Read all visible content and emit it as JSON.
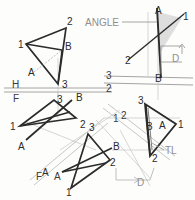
{
  "drawing": {
    "title": "Descriptive geometry — angle between line and plane",
    "callouts": {
      "angle": "ANGLE",
      "true_length": "TL",
      "dim_d_top": "D",
      "dim_d_bottom": "D"
    },
    "fold_lines": [
      {
        "name": "h-f",
        "upper": "H",
        "lower": "F",
        "orientation": "horizontal"
      },
      {
        "name": "three-two",
        "upper": "3",
        "lower": "2",
        "orientation": "horizontal"
      },
      {
        "name": "one-two",
        "upper": "1",
        "lower": "2",
        "orientation": "diagonal"
      },
      {
        "name": "f-a",
        "upper": "F",
        "lower": "A",
        "orientation": "diagonal"
      }
    ],
    "views": [
      {
        "name": "top-view",
        "vertices": [
          {
            "label": "1",
            "x": 22,
            "y": 44
          },
          {
            "label": "2",
            "x": 66,
            "y": 22
          },
          {
            "label": "3",
            "x": 58,
            "y": 80
          }
        ],
        "points": [
          {
            "label": "A",
            "x": 26,
            "y": 71
          },
          {
            "label": "B",
            "x": 62,
            "y": 46
          }
        ]
      },
      {
        "name": "front-view",
        "vertices": [
          {
            "label": "1",
            "x": 15,
            "y": 125
          },
          {
            "label": "2",
            "x": 70,
            "y": 125
          },
          {
            "label": "3",
            "x": 50,
            "y": 97
          }
        ],
        "points": [
          {
            "label": "A",
            "x": 21,
            "y": 144
          },
          {
            "label": "B",
            "x": 74,
            "y": 94
          }
        ]
      },
      {
        "name": "auxiliary-view-1",
        "vertices": [
          {
            "label": "1",
            "x": 70,
            "y": 186
          },
          {
            "label": "2",
            "x": 104,
            "y": 165
          },
          {
            "label": "3",
            "x": 88,
            "y": 130
          }
        ],
        "points": [
          {
            "label": "A",
            "x": 50,
            "y": 174
          },
          {
            "label": "B",
            "x": 114,
            "y": 146
          }
        ]
      },
      {
        "name": "auxiliary-view-2",
        "vertices": [
          {
            "label": "3",
            "x": 144,
            "y": 100
          },
          {
            "label": "1",
            "x": 176,
            "y": 125
          },
          {
            "label": "2",
            "x": 152,
            "y": 153
          }
        ],
        "points": [
          {
            "label": "A",
            "x": 158,
            "y": 126
          },
          {
            "label": "B",
            "x": 147,
            "y": 125
          }
        ]
      },
      {
        "name": "edge-view",
        "vertices": [
          {
            "label": "2",
            "x": 127,
            "y": 58
          },
          {
            "label": "1",
            "x": 182,
            "y": 16
          }
        ],
        "points": [
          {
            "label": "A",
            "x": 156,
            "y": 12
          },
          {
            "label": "B",
            "x": 158,
            "y": 75
          }
        ]
      }
    ],
    "colors": {
      "object_line": "#2b2b2b",
      "construction_line": "#b7b7b7",
      "fold_line": "#9a9a9a",
      "label_text": "#3b3b3b",
      "callout_text": "#8f8f8f",
      "angle_fill": "#d8d8d8",
      "paper": "#fdfdfc"
    }
  }
}
